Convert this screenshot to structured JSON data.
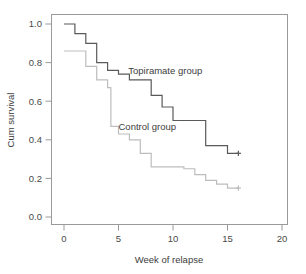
{
  "chart_data": {
    "type": "line",
    "subtype": "kaplan-meier-step",
    "title": "",
    "xlabel": "Week of relapse",
    "ylabel": "Cum survival",
    "xlim": [
      0,
      21.5
    ],
    "ylim": [
      0.0,
      1.05
    ],
    "xticks": [
      0,
      5,
      10,
      15,
      20
    ],
    "xtick_labels": [
      "0",
      "5",
      "10",
      "15",
      "20"
    ],
    "yticks": [
      0.0,
      0.2,
      0.4,
      0.6,
      0.8,
      1.0
    ],
    "ytick_labels": [
      "0.0",
      "0.2",
      "0.4",
      "0.6",
      "0.8",
      "1.0"
    ],
    "grid": false,
    "legend_position": "inline-annotation",
    "frame": "full-box",
    "series": [
      {
        "name": "Topiramate group",
        "color": "#5a5a5a",
        "annotation_label": "Topiramate group",
        "annotation_x": 5.9,
        "annotation_y": 0.755,
        "points": [
          {
            "x": 0.0,
            "y": 1.0
          },
          {
            "x": 1.0,
            "y": 0.95
          },
          {
            "x": 2.0,
            "y": 0.9
          },
          {
            "x": 3.0,
            "y": 0.8
          },
          {
            "x": 4.0,
            "y": 0.76
          },
          {
            "x": 5.0,
            "y": 0.74
          },
          {
            "x": 6.0,
            "y": 0.71
          },
          {
            "x": 8.0,
            "y": 0.63
          },
          {
            "x": 9.0,
            "y": 0.57
          },
          {
            "x": 10.0,
            "y": 0.5
          },
          {
            "x": 13.0,
            "y": 0.37
          },
          {
            "x": 15.0,
            "y": 0.33
          },
          {
            "x": 16.0,
            "y": 0.33
          }
        ],
        "censored": [
          {
            "x": 16.0,
            "y": 0.33
          }
        ]
      },
      {
        "name": "Control group",
        "color": "#bdbdbd",
        "annotation_label": "Control group",
        "annotation_x": 5.0,
        "annotation_y": 0.465,
        "points": [
          {
            "x": 0.0,
            "y": 0.86
          },
          {
            "x": 2.0,
            "y": 0.78
          },
          {
            "x": 3.0,
            "y": 0.71
          },
          {
            "x": 4.0,
            "y": 0.67
          },
          {
            "x": 4.3,
            "y": 0.47
          },
          {
            "x": 5.0,
            "y": 0.43
          },
          {
            "x": 6.0,
            "y": 0.4
          },
          {
            "x": 7.0,
            "y": 0.33
          },
          {
            "x": 8.0,
            "y": 0.26
          },
          {
            "x": 11.0,
            "y": 0.25
          },
          {
            "x": 12.0,
            "y": 0.22
          },
          {
            "x": 13.0,
            "y": 0.19
          },
          {
            "x": 14.0,
            "y": 0.17
          },
          {
            "x": 15.0,
            "y": 0.15
          },
          {
            "x": 16.0,
            "y": 0.15
          }
        ],
        "censored": [
          {
            "x": 16.0,
            "y": 0.15
          }
        ]
      }
    ]
  },
  "colors": {
    "axis": "#9a9a9a",
    "text": "#3c3c3c",
    "tick_text": "#4a4a4a",
    "topiramate": "#5a5a5a",
    "control": "#bdbdbd",
    "background": "#ffffff"
  }
}
